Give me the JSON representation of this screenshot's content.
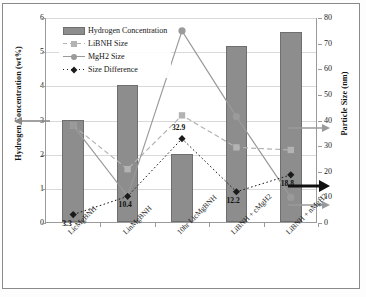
{
  "figure": {
    "caption_axis_left": "Hydrogen Concentration (wt%)",
    "caption_axis_right": "Particle Size (nm)"
  },
  "legend": {
    "position": "top-left-inside",
    "items": [
      {
        "label": "Hydrogen Concentration",
        "marker": "bar-swatch",
        "color": "#8d8d8d"
      },
      {
        "label": "LiBNH Size",
        "marker": "square-dashed-line",
        "color": "#b3b3b3"
      },
      {
        "label": "MgH2 Size",
        "marker": "circle-solid-line",
        "color": "#9a9a9a"
      },
      {
        "label": "Size Difference",
        "marker": "diamond-dotted-line",
        "color": "#1a1a1a"
      }
    ]
  },
  "axes": {
    "left_ticks": [
      "0",
      "1",
      "2",
      "3",
      "4",
      "5",
      "6"
    ],
    "right_ticks": [
      "0",
      "10",
      "20",
      "30",
      "40",
      "50",
      "60",
      "70",
      "80"
    ]
  },
  "annotations": [
    {
      "name": "left-axis-arrow",
      "text": "",
      "points": "left"
    },
    {
      "name": "right-axis-arrow-upper",
      "text": "",
      "points": "right"
    },
    {
      "name": "right-axis-arrow-bold",
      "text": "",
      "points": "right"
    },
    {
      "name": "right-axis-arrow-lower",
      "text": "",
      "points": "right"
    }
  ],
  "chart_data": {
    "type": "bar",
    "title": "",
    "xlabel": "",
    "ylabel": "Hydrogen Concentration (wt%)",
    "y2label": "Particle Size (nm)",
    "ylim": [
      0,
      6
    ],
    "y2lim": [
      0,
      80
    ],
    "grid": true,
    "categories": [
      "LicMgBNH",
      "LinMgBNH",
      "10hr LicMgBNH",
      "LiBNH + cMgH2",
      "LiBNH + nMgH2"
    ],
    "series": [
      {
        "name": "Hydrogen Concentration",
        "type": "bar",
        "axis": "left",
        "unit": "wt%",
        "color": "#8d8d8d",
        "values": [
          3.0,
          4.0,
          2.0,
          5.15,
          5.55
        ]
      },
      {
        "name": "LiBNH Size",
        "type": "line",
        "axis": "right",
        "unit": "nm",
        "style": "dashed",
        "marker": "square",
        "color": "#b3b3b3",
        "values": [
          38.0,
          21.0,
          42.0,
          29.5,
          28.5
        ]
      },
      {
        "name": "MgH2 Size",
        "type": "line",
        "axis": "right",
        "unit": "nm",
        "style": "solid",
        "marker": "circle",
        "color": "#9a9a9a",
        "values": [
          38.0,
          10.5,
          75.0,
          41.5,
          10.0
        ]
      },
      {
        "name": "Size Difference",
        "type": "line",
        "axis": "right",
        "unit": "nm",
        "style": "dotted",
        "marker": "diamond",
        "color": "#1a1a1a",
        "values": [
          3.3,
          10.4,
          32.9,
          12.2,
          18.8
        ],
        "data_labels": [
          "3.3",
          "10.4",
          "32.9",
          "12.2",
          "18.8"
        ]
      }
    ]
  }
}
